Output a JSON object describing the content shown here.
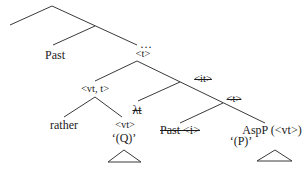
{
  "diagram": {
    "type": "syntax-tree",
    "nodes": {
      "ellipsis": "…",
      "t_top": "<t>",
      "past": "Past",
      "vt_t": "<vt, t>",
      "it_struck": "<it>",
      "lambda_t_struck": "λt",
      "t_struck": "<t>",
      "rather": "rather",
      "vt": "<vt>",
      "q_gloss": "‘(Q)’",
      "past_i_struck": "Past <i>",
      "aspp": "AspP (<vt>)",
      "p_gloss": "‘(P)’"
    },
    "line_color": "#3a3a3a",
    "text_color": "#1a1a1a"
  }
}
